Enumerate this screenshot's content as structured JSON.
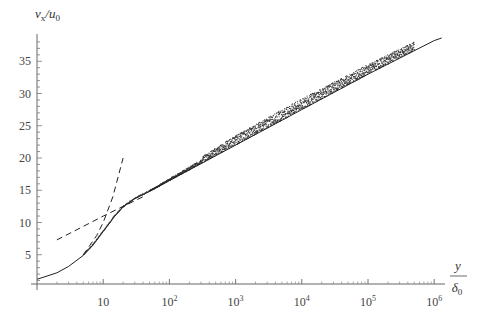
{
  "chart_data": {
    "type": "line",
    "title": "",
    "xlabel": "y / δ0",
    "ylabel": "v_x / u_0",
    "xscale": "log",
    "xlim": [
      1,
      1000000
    ],
    "ylim": [
      0,
      39
    ],
    "grid": false,
    "legend": null,
    "x_ticks": [
      {
        "value": 10,
        "label": "10",
        "exp": ""
      },
      {
        "value": 100,
        "label": "10",
        "exp": "2"
      },
      {
        "value": 1000,
        "label": "10",
        "exp": "3"
      },
      {
        "value": 10000,
        "label": "10",
        "exp": "4"
      },
      {
        "value": 100000,
        "label": "10",
        "exp": "5"
      },
      {
        "value": 1000000,
        "label": "10",
        "exp": "6"
      }
    ],
    "y_ticks": [
      5,
      10,
      15,
      20,
      25,
      30,
      35
    ],
    "series": [
      {
        "name": "solid profile",
        "style": "solid",
        "x": [
          1,
          2,
          3,
          5,
          7,
          10,
          15,
          20,
          30,
          50,
          100,
          1000,
          10000,
          100000,
          1000000,
          1300000
        ],
        "y": [
          1.2,
          2.2,
          3.2,
          4.9,
          6.5,
          8.6,
          11.0,
          12.4,
          13.7,
          14.8,
          16.5,
          22.0,
          27.5,
          33.0,
          38.2,
          38.6
        ]
      },
      {
        "name": "viscous sublayer asymptote (u = y)",
        "style": "dashed",
        "x": [
          5,
          8,
          10,
          14,
          20
        ],
        "y": [
          5,
          8,
          10,
          14,
          20
        ]
      },
      {
        "name": "log-law asymptote",
        "style": "dashed",
        "x": [
          2,
          5,
          10,
          20,
          40
        ],
        "y": [
          7.3,
          9.4,
          11.0,
          12.5,
          14.0
        ]
      },
      {
        "name": "dotted data scatter (spread upper bound)",
        "style": "dotted",
        "x": [
          5,
          50,
          100,
          1000,
          10000,
          100000,
          500000
        ],
        "y": [
          5,
          15,
          17.0,
          23.5,
          29.2,
          34.5,
          38.0
        ]
      }
    ]
  }
}
